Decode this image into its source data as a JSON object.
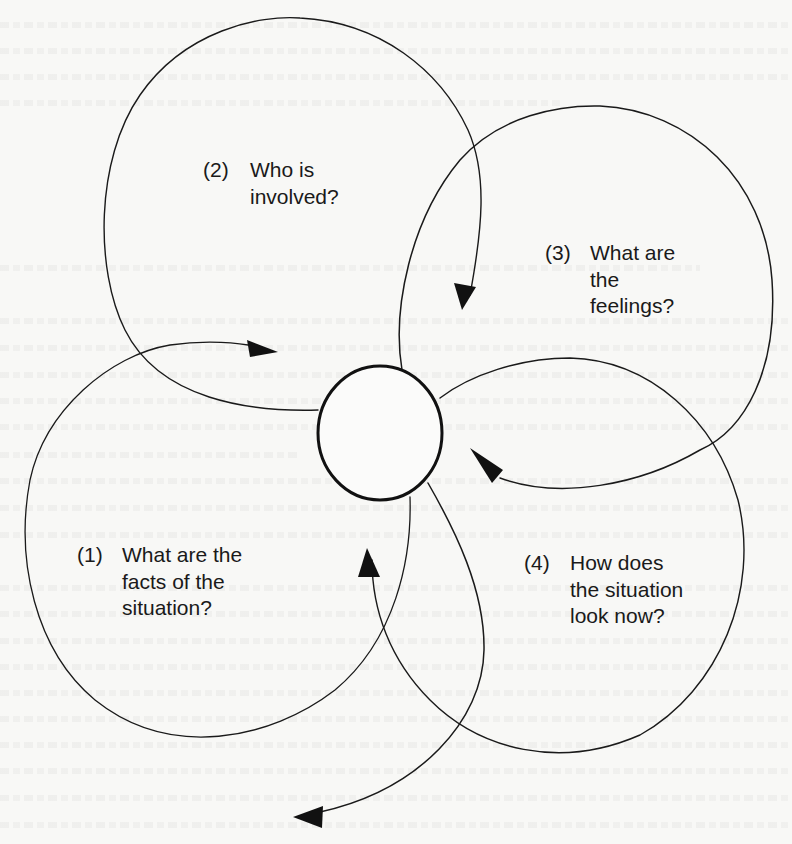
{
  "diagram": {
    "type": "cyclic-loop-diagram",
    "center": {
      "shape": "circle",
      "label": ""
    },
    "colors": {
      "ink": "#1a1a1a",
      "paper": "#f8f8f6"
    },
    "steps": [
      {
        "number": "(1)",
        "lines": [
          "What are the",
          "facts of the",
          "situation?"
        ]
      },
      {
        "number": "(2)",
        "lines": [
          "Who is",
          "involved?"
        ]
      },
      {
        "number": "(3)",
        "lines": [
          "What are",
          "the",
          "feelings?"
        ]
      },
      {
        "number": "(4)",
        "lines": [
          "How does",
          "the situation",
          "look now?"
        ]
      }
    ],
    "icons": {
      "loop_arrow": "arrowhead-icon"
    }
  }
}
